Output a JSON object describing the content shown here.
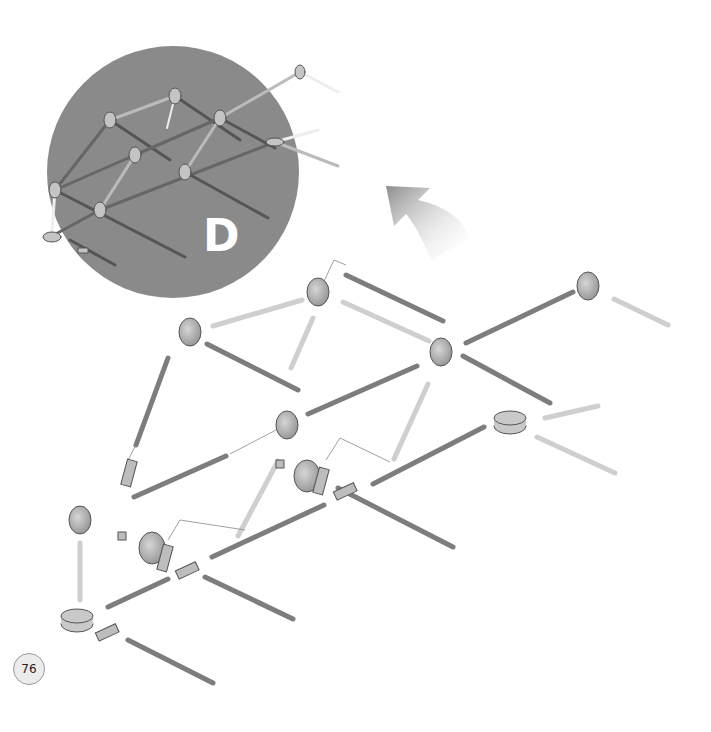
{
  "page": {
    "page_number": "76",
    "step_label": "D",
    "colors": {
      "inset_background": "#8a8a8a",
      "rod_dark": "#7d7d7d",
      "rod_light": "#e2e2e2",
      "connector": "#b5b5b5",
      "arrow_gradient_start": "#8c8c8c",
      "page_badge_bg": "#ececec"
    }
  },
  "inset": {
    "description": "Assembled frame preview",
    "label": "D"
  },
  "direction_arrow": {
    "icon": "curved-arrow-up-left-icon"
  },
  "parts": {
    "wheels": 8,
    "hubs": 2,
    "dark_rods": 15,
    "light_rods": 7,
    "couplers": 6
  }
}
